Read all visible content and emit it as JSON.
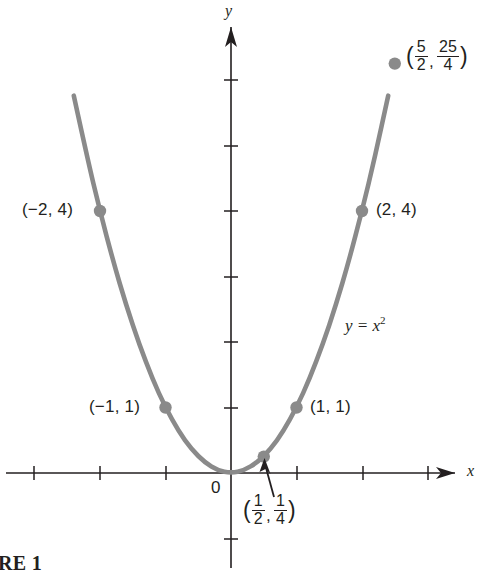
{
  "figure": {
    "caption": "RE 1",
    "axis_x_label": "x",
    "axis_y_label": "y",
    "origin_label": "0",
    "curve_color": "#8a8a8a",
    "axis_color": "#231f20",
    "point_color": "#8a8a8a",
    "background": "#ffffff"
  },
  "chart_data": {
    "type": "line",
    "title": "",
    "xlabel": "x",
    "ylabel": "y",
    "equation": "y = x2",
    "equation_base": "y = x",
    "equation_exponent": "2",
    "grid": false,
    "legend": "none",
    "xlim": [
      -3.5,
      4.0
    ],
    "ylim": [
      -1.3,
      7.2
    ],
    "x_ticks": [
      -3,
      -2,
      -1,
      1,
      2,
      3
    ],
    "y_ticks": [
      -1,
      1,
      2,
      3,
      4,
      5,
      6
    ],
    "function": "y = x^2",
    "series": [
      {
        "name": "y = x^2",
        "x": [
          -3.05,
          -2.8,
          -2.6,
          -2.4,
          -2.2,
          -2.0,
          -1.8,
          -1.6,
          -1.4,
          -1.2,
          -1.0,
          -0.8,
          -0.6,
          -0.4,
          -0.2,
          0.0,
          0.2,
          0.4,
          0.6,
          0.8,
          1.0,
          1.2,
          1.4,
          1.6,
          1.8,
          2.0,
          2.2,
          2.4,
          2.6,
          2.65
        ],
        "values": [
          9.3,
          7.84,
          6.76,
          5.76,
          4.84,
          4.0,
          3.24,
          2.56,
          1.96,
          1.44,
          1.0,
          0.64,
          0.36,
          0.16,
          0.04,
          0.0,
          0.04,
          0.16,
          0.36,
          0.64,
          1.0,
          1.44,
          1.96,
          2.56,
          3.24,
          4.0,
          4.84,
          5.76,
          6.76,
          7.02
        ]
      }
    ],
    "marked_points": [
      {
        "id": "pt-neg2-4",
        "x": -2,
        "y": 4,
        "label_text": "(−2, 4)",
        "label_type": "plain",
        "label_side": "left"
      },
      {
        "id": "pt-neg1-1",
        "x": -1,
        "y": 1,
        "label_text": "(−1, 1)",
        "label_type": "plain",
        "label_side": "left"
      },
      {
        "id": "pt-half",
        "x": 0.5,
        "y": 0.25,
        "label_type": "fraction",
        "label_num_x": "1",
        "label_den_x": "2",
        "label_num_y": "1",
        "label_den_y": "4",
        "label_side": "below",
        "has_arrow": true
      },
      {
        "id": "pt-1-1",
        "x": 1,
        "y": 1,
        "label_text": "(1, 1)",
        "label_type": "plain",
        "label_side": "right"
      },
      {
        "id": "pt-2-4",
        "x": 2,
        "y": 4,
        "label_text": "(2, 4)",
        "label_type": "plain",
        "label_side": "right"
      },
      {
        "id": "pt-52-254",
        "x": 2.5,
        "y": 6.25,
        "label_type": "fraction",
        "label_num_x": "5",
        "label_den_x": "2",
        "label_num_y": "25",
        "label_den_y": "4",
        "label_side": "right"
      }
    ],
    "annotations": [
      {
        "id": "equation-annotation",
        "text": "y = x2"
      }
    ]
  },
  "labels": {
    "neg2_4": "(−2, 4)",
    "neg1_1": "(−1, 1)",
    "one_one": "(1, 1)",
    "two_four": "(2, 4)",
    "open_paren": "(",
    "close_paren": ")",
    "comma": ",",
    "frac_half_num": "1",
    "frac_half_den": "2",
    "frac_quarter_num": "1",
    "frac_quarter_den": "4",
    "frac_fivehalf_num": "5",
    "frac_fivehalf_den": "2",
    "frac_twentyfivefourth_num": "25",
    "frac_twentyfivefourth_den": "4",
    "eq_base": "y = x",
    "eq_exp": "2"
  }
}
